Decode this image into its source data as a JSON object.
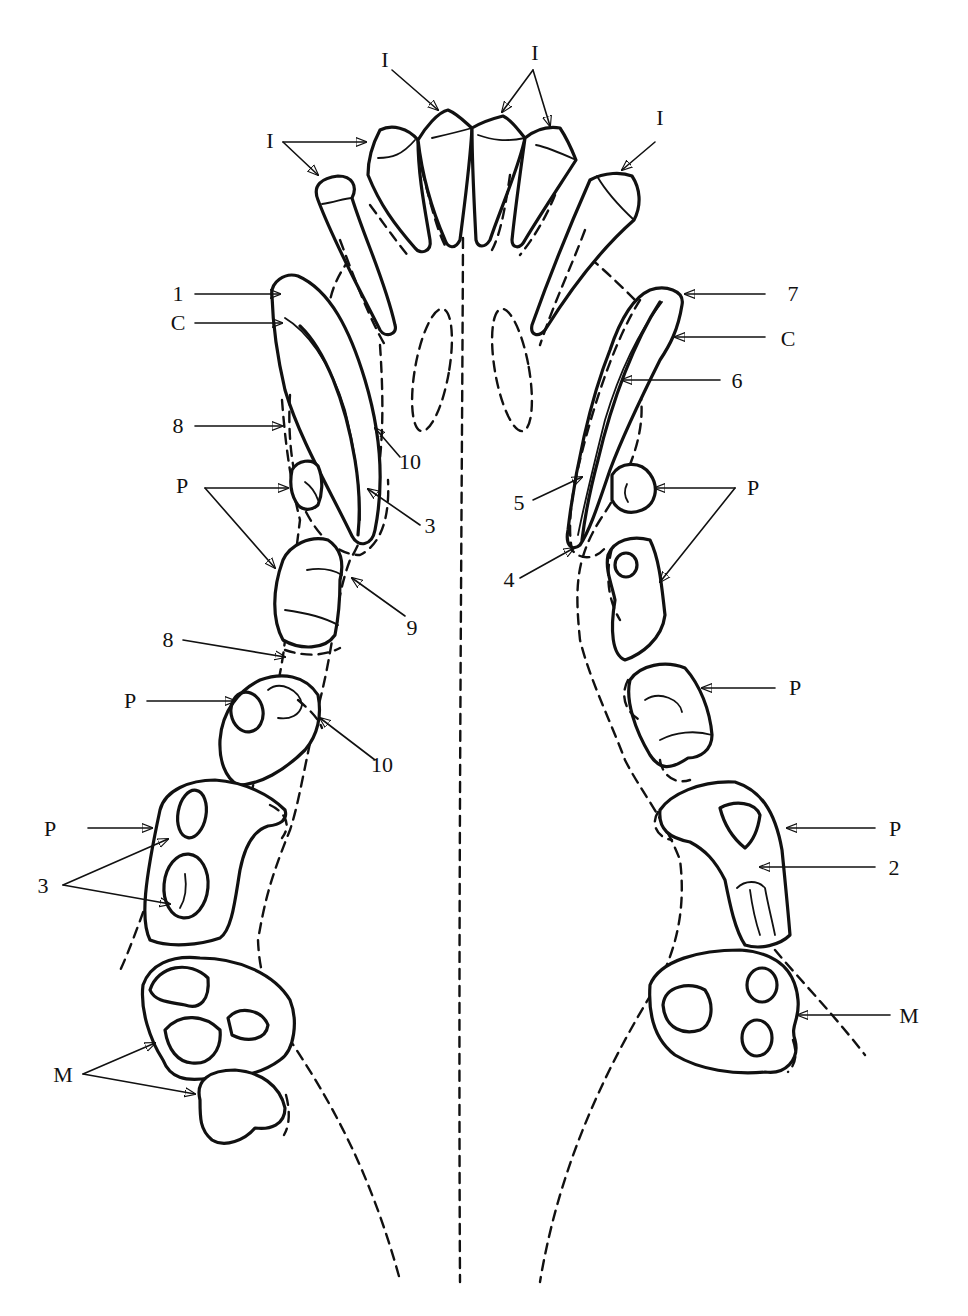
{
  "figure": {
    "type": "anatomical line drawing",
    "background": "#ffffff",
    "ink": "#111111"
  },
  "labels": {
    "incisor_top_left": "I",
    "incisor_top_center": "I",
    "incisor_top_right": "I",
    "incisor_left": "I",
    "canine_left_1": "1",
    "canine_left_C": "C",
    "canine_left_8": "8",
    "canine_left_10": "10",
    "canine_left_3": "3",
    "premolar_left_P1": "P",
    "premolar_left_9": "9",
    "premolar_left_8": "8",
    "premolar_left_P2": "P",
    "premolar_left_10": "10",
    "premolar_left_P3": "P",
    "premolar_left_3": "3",
    "molar_left_M": "M",
    "canine_right_7": "7",
    "canine_right_C": "C",
    "canine_right_6": "6",
    "canine_right_5": "5",
    "canine_right_4": "4",
    "premolar_right_P1": "P",
    "premolar_right_P2": "P",
    "premolar_right_P3": "P",
    "premolar_right_2": "2",
    "molar_right_M": "M"
  },
  "legend_codes": {
    "I": "incisor",
    "C": "canine",
    "P": "premolar",
    "M": "molar"
  }
}
